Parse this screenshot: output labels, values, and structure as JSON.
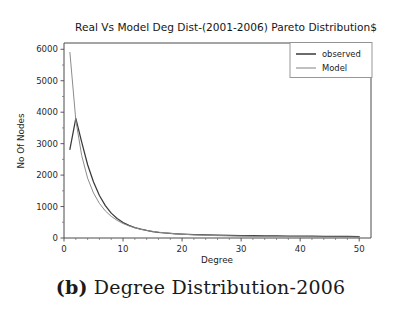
{
  "figure": {
    "caption_label": "(b)",
    "caption_text": "Degree Distribution-2006",
    "background": "#ffffff"
  },
  "chart_data": {
    "type": "line",
    "title": "Real Vs Model Deg Dist-(2001-2006) Pareto Distribution$",
    "xlabel": "Degree",
    "ylabel": "No Of Nodes",
    "xlim": [
      0,
      52
    ],
    "ylim": [
      0,
      6200
    ],
    "xticks": [
      0,
      10,
      20,
      30,
      40,
      50
    ],
    "xtick_labels": [
      "0",
      "10",
      "20",
      "30",
      "40",
      "50"
    ],
    "yticks": [
      0,
      1000,
      2000,
      3000,
      4000,
      5000,
      6000
    ],
    "ytick_labels": [
      "0",
      "1000",
      "2000",
      "3000",
      "4000",
      "5000",
      "6000"
    ],
    "grid": false,
    "legend_position": "upper right",
    "x": [
      1,
      2,
      3,
      4,
      5,
      6,
      7,
      8,
      9,
      10,
      11,
      12,
      13,
      14,
      15,
      16,
      17,
      18,
      19,
      20,
      22,
      24,
      26,
      28,
      30,
      32,
      34,
      36,
      38,
      40,
      42,
      44,
      46,
      48,
      50
    ],
    "series": [
      {
        "name": "observed",
        "color": "#3a3a3a",
        "values": [
          2820,
          3800,
          3050,
          2330,
          1780,
          1350,
          1030,
          790,
          620,
          490,
          400,
          330,
          280,
          240,
          205,
          180,
          160,
          145,
          132,
          122,
          108,
          98,
          90,
          84,
          79,
          74,
          70,
          66,
          62,
          59,
          56,
          53,
          50,
          48,
          46
        ]
      },
      {
        "name": "Model",
        "color": "#8c8c8c",
        "values": [
          5900,
          3750,
          2620,
          1900,
          1430,
          1100,
          860,
          690,
          560,
          460,
          385,
          325,
          278,
          240,
          210,
          185,
          164,
          147,
          132,
          120,
          100,
          86,
          75,
          66,
          59,
          53,
          48,
          44,
          40,
          37,
          34,
          32,
          30,
          28,
          26
        ]
      }
    ],
    "legend_entries": [
      {
        "label": "observed",
        "color": "#3a3a3a"
      },
      {
        "label": "Model",
        "color": "#8c8c8c"
      }
    ],
    "plot_area": {
      "left": 64,
      "right": 371,
      "top": 43,
      "bottom": 238
    }
  }
}
